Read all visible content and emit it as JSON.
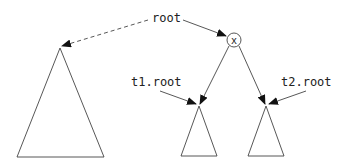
{
  "diagram": {
    "type": "tree-split",
    "labels": {
      "root": "root",
      "t1_root": "t1.root",
      "t2_root": "t2.root",
      "node_x": "x"
    },
    "nodes": [
      {
        "id": "x",
        "label": "x",
        "shape": "circle"
      }
    ],
    "subtrees": [
      {
        "id": "whole-tree",
        "size": "large"
      },
      {
        "id": "t1",
        "size": "small",
        "parent": "x",
        "side": "left"
      },
      {
        "id": "t2",
        "size": "small",
        "parent": "x",
        "side": "right"
      }
    ],
    "pointers": [
      {
        "from": "root",
        "to": "x",
        "style": "solid"
      },
      {
        "from": "root",
        "to": "whole-tree",
        "style": "dashed"
      },
      {
        "from": "t1.root",
        "to": "t1",
        "style": "solid"
      },
      {
        "from": "t2.root",
        "to": "t2",
        "style": "solid"
      }
    ],
    "colors": {
      "stroke": "#333333",
      "background": "#ffffff"
    }
  }
}
